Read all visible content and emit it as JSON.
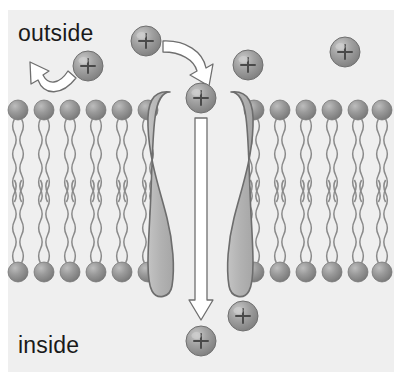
{
  "figure": {
    "width": 402,
    "height": 379,
    "background_color": "#ffffff",
    "panel_color": "#efefef"
  },
  "labels": {
    "outside": "outside",
    "inside": "inside"
  },
  "colors": {
    "panel_background": "#efefef",
    "lipid_head_fill": "#8d8d8d",
    "lipid_head_highlight": "#b7b7b7",
    "lipid_tail_stroke": "#8a8a8a",
    "ion_fill": "#9a9a9a",
    "ion_highlight": "#c2c2c2",
    "ion_stroke": "#6f6f6f",
    "ion_plus": "#4a4a4a",
    "channel_fill": "#b3b3b3",
    "channel_stroke": "#6d6d6d",
    "arrow_fill": "#ffffff",
    "arrow_stroke": "#6f6f6f",
    "text_color": "#1a1a1a"
  },
  "membrane": {
    "outer_leaflet_y": 110,
    "inner_leaflet_y": 272,
    "head_radius": 10,
    "left_segment": {
      "x_start": 18,
      "count": 6,
      "spacing": 26
    },
    "right_segment": {
      "x_start": 254,
      "count": 6,
      "spacing": 26
    },
    "tail_count_per_head": 2
  },
  "channel": {
    "name": "ion-channel-protein",
    "lobes": 2,
    "pore_label": "+",
    "center_x": 200,
    "top_y": 88,
    "bottom_y": 296
  },
  "ions": [
    {
      "id": "ion-rejected-outside",
      "label": "+",
      "cx": 88,
      "cy": 66,
      "r": 15,
      "region": "outside"
    },
    {
      "id": "ion-entering-outside",
      "label": "+",
      "cx": 146,
      "cy": 41,
      "r": 15,
      "region": "outside"
    },
    {
      "id": "ion-in-pore-mouth",
      "label": "+",
      "cx": 201,
      "cy": 98,
      "r": 15,
      "region": "pore"
    },
    {
      "id": "ion-outside-mid-right",
      "label": "+",
      "cx": 248,
      "cy": 65,
      "r": 15,
      "region": "outside"
    },
    {
      "id": "ion-outside-far-right",
      "label": "+",
      "cx": 345,
      "cy": 52,
      "r": 15,
      "region": "outside"
    },
    {
      "id": "ion-inside-right",
      "label": "+",
      "cx": 243,
      "cy": 316,
      "r": 15,
      "region": "inside"
    },
    {
      "id": "ion-inside-below-pore",
      "label": "+",
      "cx": 201,
      "cy": 341,
      "r": 15,
      "region": "inside"
    }
  ],
  "arrows": [
    {
      "id": "arrow-rejection",
      "description": "curved arrow turning back up-left, ion rejected by membrane",
      "direction": "up-left"
    },
    {
      "id": "arrow-entry",
      "description": "curved arrow from outside down into channel pore",
      "direction": "down-right"
    },
    {
      "id": "arrow-transport",
      "description": "long straight arrow down through the channel pore into cell",
      "direction": "down"
    }
  ]
}
